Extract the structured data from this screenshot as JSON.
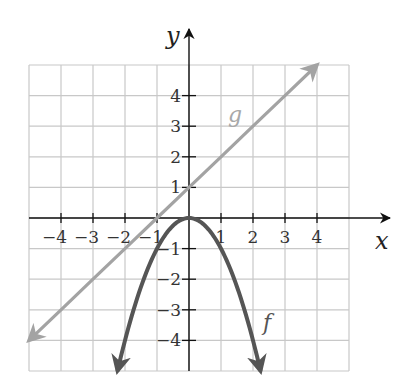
{
  "chart_data": {
    "type": "line",
    "title": "",
    "xlabel": "x",
    "ylabel": "y",
    "xlim": [
      -5,
      5
    ],
    "ylim": [
      -5,
      5
    ],
    "grid": true,
    "x_ticks": [
      -4,
      -3,
      -2,
      -1,
      1,
      2,
      3,
      4
    ],
    "y_ticks": [
      -4,
      -3,
      -2,
      -1,
      1,
      2,
      3,
      4
    ],
    "x_tick_labels": [
      "−4",
      "−3",
      "−2",
      "−1",
      "1",
      "2",
      "3",
      "4"
    ],
    "y_tick_labels": [
      "−4",
      "−3",
      "−2",
      "−1",
      "1",
      "2",
      "3",
      "4"
    ],
    "series": [
      {
        "name": "f",
        "equation": "f(x) = -x^2",
        "color": "#555555",
        "x": [
          -2.236,
          -2,
          -1.5,
          -1,
          -0.5,
          0,
          0.5,
          1,
          1.5,
          2,
          2.236
        ],
        "y": [
          -5,
          -4,
          -2.25,
          -1,
          -0.25,
          0,
          -0.25,
          -1,
          -2.25,
          -4,
          -5
        ],
        "arrows": "both-ends"
      },
      {
        "name": "g",
        "equation": "g(x) = x + 1",
        "color": "#a3a3a3",
        "x": [
          -5,
          -4,
          -3,
          -2,
          -1,
          0,
          1,
          2,
          3,
          4
        ],
        "y": [
          -4,
          -3,
          -2,
          -1,
          0,
          1,
          2,
          3,
          4,
          5
        ],
        "arrows": "both-ends"
      }
    ],
    "annotations": [
      {
        "text": "g",
        "x": 1.4,
        "y": 3.2,
        "color": "#a8a8a8"
      },
      {
        "text": "f",
        "x": 2.5,
        "y": -3.5,
        "color": "#555555"
      }
    ]
  },
  "labels": {
    "x_axis": "x",
    "y_axis": "y",
    "f": "f",
    "g": "g"
  }
}
